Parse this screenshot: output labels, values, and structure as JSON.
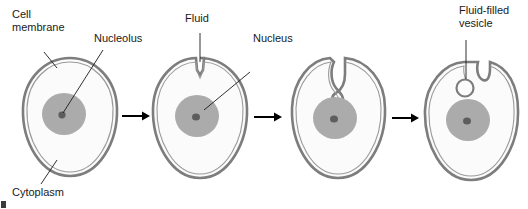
{
  "diagram": {
    "background_color": "#ffffff",
    "membrane_color": "#7d7d7d",
    "cytoplasm_color": "#fbfbfb",
    "nucleus_color": "#ababab",
    "nucleolus_color": "#5d5d5d",
    "arrow_color": "#000000",
    "text_color": "#1a1a1a"
  },
  "labels": {
    "cell_membrane_line1": "Cell",
    "cell_membrane_line2": "membrane",
    "nucleolus": "Nucleolus",
    "cytoplasm": "Cytoplasm",
    "fluid": "Fluid",
    "nucleus": "Nucleus",
    "vesicle_line1": "Fluid-filled",
    "vesicle_line2": "vesicle"
  },
  "stages": [
    {
      "index": 1,
      "name": "intact-cell",
      "membrane_state": "smooth",
      "labels": [
        "Cell membrane",
        "Nucleolus",
        "Cytoplasm"
      ]
    },
    {
      "index": 2,
      "name": "membrane-dimple",
      "membrane_state": "shallow-notch",
      "labels": [
        "Fluid",
        "Nucleus"
      ]
    },
    {
      "index": 3,
      "name": "deep-invagination",
      "membrane_state": "deep-channel-with-bulb",
      "labels": []
    },
    {
      "index": 4,
      "name": "vesicle-pinched-off",
      "membrane_state": "notch-with-detached-vesicle",
      "labels": [
        "Fluid-filled vesicle"
      ]
    }
  ],
  "arrows": [
    {
      "index": 1,
      "from_stage": 1,
      "to_stage": 2
    },
    {
      "index": 2,
      "from_stage": 2,
      "to_stage": 3
    },
    {
      "index": 3,
      "from_stage": 3,
      "to_stage": 4
    }
  ]
}
